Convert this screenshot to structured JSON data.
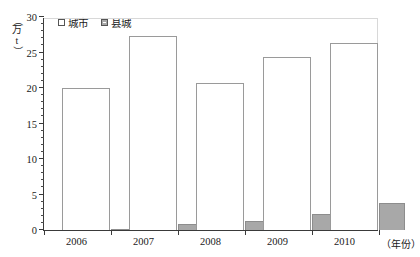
{
  "chart_data": {
    "type": "bar",
    "title": "",
    "xlabel": "（年份）",
    "ylabel": "（万 t）",
    "categories": [
      "2006",
      "2007",
      "2008",
      "2009",
      "2010"
    ],
    "series": [
      {
        "name": "城市",
        "values": [
          20.0,
          27.3,
          20.7,
          24.3,
          26.3
        ],
        "color": "#ffffff"
      },
      {
        "name": "县城",
        "values": [
          0.15,
          0.8,
          1.2,
          2.2,
          3.8
        ],
        "color": "#a8a8a8"
      }
    ],
    "ylim": [
      0,
      30
    ],
    "ytick_labels": [
      "0",
      "5",
      "10",
      "15",
      "20",
      "25",
      "30"
    ],
    "ytick_values": [
      0,
      5,
      10,
      15,
      20,
      25,
      30
    ],
    "yminor_step": 1,
    "grid": false,
    "legend_position": "top-left"
  },
  "axis": {
    "unit_open_paren": "（",
    "unit_text": "万",
    "unit_symbol": "t",
    "unit_close_paren": "）"
  },
  "legend": {
    "items": [
      {
        "label": "城市"
      },
      {
        "label": "县城"
      }
    ]
  }
}
